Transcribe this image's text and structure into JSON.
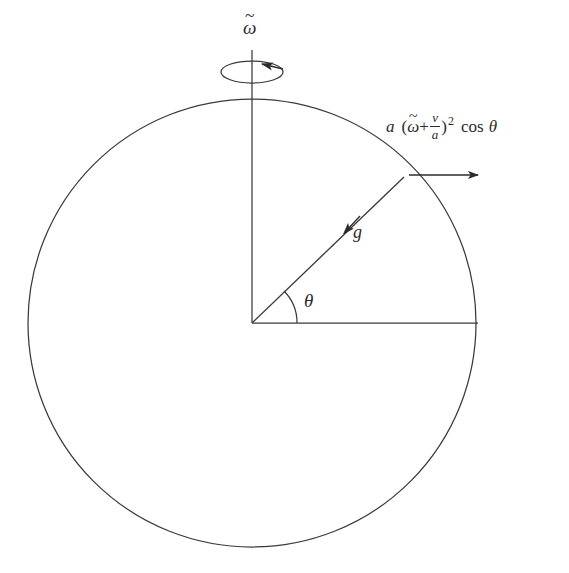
{
  "figure": {
    "background_color": "#ffffff",
    "stroke_color": "#3a3a3a",
    "text_color": "#2b2b2b"
  },
  "labels": {
    "spin_axis": {
      "symbol_base": "ω",
      "accent": "~",
      "meaning": "angular-velocity-omega-tilde"
    },
    "gravity_vector": {
      "symbol": "g",
      "meaning": "gravitational-acceleration"
    },
    "angle": {
      "symbol": "θ",
      "meaning": "latitude-angle-theta"
    },
    "centripetal": {
      "a_coefficient": "a",
      "open_paren": "(",
      "omega_base": "ω",
      "omega_accent": "~",
      "plus": "+",
      "fraction_numerator": "v",
      "fraction_denominator": "a",
      "close_paren": ")",
      "exponent": "2",
      "cos": "cos",
      "theta": "θ",
      "plain_text": "a (ω̃ + v/a)² cos θ"
    }
  },
  "geometry": {
    "circle": {
      "cx": 252,
      "cy": 323,
      "r": 224
    },
    "spin_ellipse": {
      "cx": 252,
      "cy": 72,
      "rx": 31,
      "ry": 11
    },
    "axis_line": {
      "x": 252,
      "y_top": 50,
      "y_bottom": 323
    },
    "horizontal_radius": {
      "x1": 252,
      "y1": 323,
      "x2": 478,
      "y2": 323
    },
    "tilted_radius": {
      "x1": 252,
      "y1": 323,
      "x2": 404,
      "y2": 177,
      "angle_degrees": 44
    },
    "theta_arc_radius": 45,
    "accel_arrow": {
      "x1": 408,
      "y1": 175,
      "x2": 478,
      "y2": 175
    },
    "gravity_arrowhead_at": {
      "x": 349,
      "y": 228
    }
  }
}
